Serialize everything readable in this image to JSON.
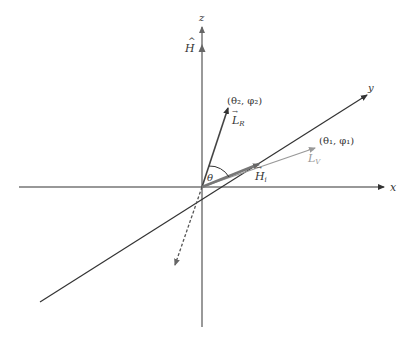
{
  "diagram": {
    "type": "3d-vector-coordinate-diagram",
    "axes": {
      "x": {
        "label": "x"
      },
      "y": {
        "label": "y"
      },
      "z": {
        "label": "z"
      }
    },
    "vectors": {
      "H_hat": {
        "label": "H",
        "label_sub": "",
        "accent": "^",
        "color": "#555555"
      },
      "L_R": {
        "label": "L",
        "label_sub": "R",
        "accent": "→",
        "endpoint_label": "(θ₂, φ₂)",
        "color": "#444444"
      },
      "L_V": {
        "label": "L",
        "label_sub": "V",
        "accent": "→",
        "endpoint_label": "(θ₁, φ₁)",
        "color": "#999999"
      },
      "H_i": {
        "label": "H",
        "label_sub": "i",
        "accent": "→",
        "color": "#777777"
      },
      "dashed": {
        "style": "dashed",
        "color": "#555555"
      }
    },
    "angle": {
      "label": "θ"
    },
    "colors": {
      "axis": "#333333",
      "background": "#ffffff"
    }
  }
}
